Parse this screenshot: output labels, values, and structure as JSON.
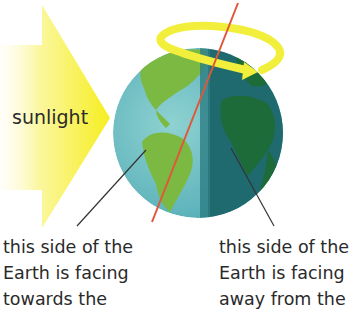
{
  "diagram": {
    "sunlight_label": "sunlight",
    "captions": {
      "left": [
        "this side of the",
        "Earth is facing",
        "towards the"
      ],
      "right": [
        "this side of the",
        "Earth is facing",
        "away from the"
      ]
    },
    "colors": {
      "sunlight": "#f6f03a",
      "axis": "#e0573a",
      "rotation_arrow": "#f2ef3c",
      "ocean_day": "#6ebfc4",
      "land_day": "#7bb943",
      "ocean_night": "#1f6a6e",
      "land_night": "#1d6b38",
      "leader_line": "#333333",
      "text": "#2a2a2a"
    }
  }
}
